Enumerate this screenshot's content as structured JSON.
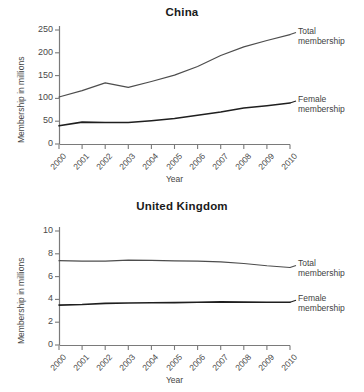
{
  "figures": [
    {
      "id": "china",
      "title": "China",
      "ylabel": "Membership in millions",
      "xlabel": "Year",
      "yticks": [
        "0",
        "50",
        "100",
        "150",
        "200",
        "250"
      ],
      "xticks": [
        "2000",
        "2001",
        "2002",
        "2003",
        "2004",
        "2005",
        "2006",
        "2007",
        "2008",
        "2009",
        "2010"
      ],
      "annotations": [
        {
          "line1": "Total",
          "line2": "membership"
        },
        {
          "line1": "Female",
          "line2": "membership"
        }
      ]
    },
    {
      "id": "uk",
      "title": "United Kingdom",
      "ylabel": "Membership in millions",
      "xlabel": "Year",
      "yticks": [
        "0",
        "2",
        "4",
        "6",
        "8",
        "10"
      ],
      "xticks": [
        "2000",
        "2001",
        "2002",
        "2003",
        "2004",
        "2005",
        "2006",
        "2007",
        "2008",
        "2009",
        "2010"
      ],
      "annotations": [
        {
          "line1": "Total",
          "line2": "membership"
        },
        {
          "line1": "Female",
          "line2": "membership"
        }
      ]
    }
  ],
  "chart_data": [
    {
      "type": "line",
      "title": "China",
      "xlabel": "Year",
      "ylabel": "Membership in millions",
      "x": [
        2000,
        2001,
        2002,
        2003,
        2004,
        2005,
        2006,
        2007,
        2008,
        2009,
        2010
      ],
      "xlim": [
        2000,
        2010
      ],
      "ylim": [
        0,
        250
      ],
      "ytick_step": 50,
      "grid": false,
      "legend_position": "right-inline-annotation",
      "series": [
        {
          "name": "Total membership",
          "color": "#4d4d4d",
          "values": [
            103,
            117,
            134,
            124,
            137,
            151,
            170,
            194,
            213,
            227,
            240
          ]
        },
        {
          "name": "Female membership",
          "color": "#1f1f1f",
          "values": [
            40,
            48,
            47,
            47,
            51,
            56,
            63,
            70,
            79,
            84,
            90
          ]
        }
      ]
    },
    {
      "type": "line",
      "title": "United Kingdom",
      "xlabel": "Year",
      "ylabel": "Membership in millions",
      "x": [
        2000,
        2001,
        2002,
        2003,
        2004,
        2005,
        2006,
        2007,
        2008,
        2009,
        2010
      ],
      "xlim": [
        2000,
        2010
      ],
      "ylim": [
        0,
        10
      ],
      "ytick_step": 2,
      "grid": false,
      "legend_position": "right-inline-annotation",
      "series": [
        {
          "name": "Total membership",
          "color": "#4d4d4d",
          "values": [
            7.4,
            7.35,
            7.35,
            7.45,
            7.42,
            7.38,
            7.35,
            7.3,
            7.15,
            6.95,
            6.8
          ]
        },
        {
          "name": "Female membership",
          "color": "#1f1f1f",
          "values": [
            3.5,
            3.55,
            3.65,
            3.68,
            3.7,
            3.72,
            3.75,
            3.78,
            3.76,
            3.75,
            3.75
          ]
        }
      ]
    }
  ]
}
